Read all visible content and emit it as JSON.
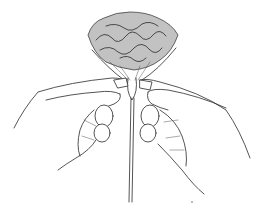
{
  "illustration": {
    "subject": "Two hands gathering a crumpled paper flower (carnation) onto a wire stem",
    "style": "black line drawing on white",
    "colors": {
      "background": "#ffffff",
      "ink": "#2a2a2a"
    },
    "elements": [
      "paper-flower-head",
      "gathered-paper-base",
      "wire-stem",
      "left-hand",
      "right-hand",
      "tape-wrap-left",
      "tape-wrap-right"
    ]
  }
}
